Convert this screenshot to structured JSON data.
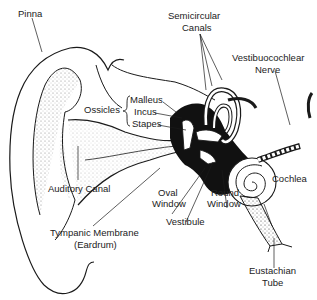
{
  "diagram": {
    "colors": {
      "ink": "#1a1a1a",
      "fill": "#111111",
      "background": "#ffffff"
    },
    "labels": {
      "pinna": "Pinna",
      "semicircular_canals_1": "Semicircular",
      "semicircular_canals_2": "Canals",
      "vestibulocochlear_1": "Vestibuocochlear",
      "vestibulocochlear_2": "Nerve",
      "ossicles": "Ossicles",
      "malleus": "Malleus",
      "incus": "Incus",
      "stapes": "Stapes",
      "auditory_canal": "Auditory Canal",
      "oval_window_1": "Oval",
      "oval_window_2": "Window",
      "round_window_1": "Round",
      "round_window_2": "Window",
      "cochlea": "Cochlea",
      "vestibule": "Vestibule",
      "tympanic_1": "Tympanic Membrane",
      "tympanic_2": "(Eardrum)",
      "eustachian_1": "Eustachian",
      "eustachian_2": "Tube"
    }
  }
}
